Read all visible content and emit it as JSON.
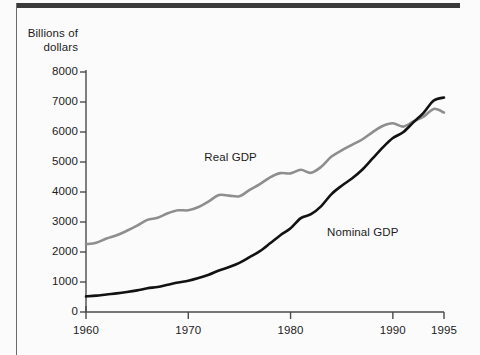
{
  "figure": {
    "background_color": "#fbfbfb",
    "frame_color": "#3a3a3a"
  },
  "chart_data": {
    "type": "line",
    "title": "",
    "subtitle": "",
    "ylabel": "Billions of\ndollars",
    "ylabel_line1": "Billions of",
    "ylabel_line2": "dollars",
    "xlabel": "",
    "xlim": [
      1960,
      1995
    ],
    "ylim": [
      0,
      8000
    ],
    "grid": false,
    "legend_position": "inline-annotations",
    "yticks": [
      0,
      1000,
      2000,
      3000,
      4000,
      5000,
      6000,
      7000,
      8000
    ],
    "ytick_labels": [
      "0",
      "1000",
      "2000",
      "3000",
      "4000",
      "5000",
      "6000",
      "7000",
      "8000"
    ],
    "xticks": [
      1960,
      1970,
      1980,
      1990,
      1995
    ],
    "xtick_labels": [
      "1960",
      "1970",
      "1980",
      "1990",
      "1995"
    ],
    "x": [
      1960,
      1961,
      1962,
      1963,
      1964,
      1965,
      1966,
      1967,
      1968,
      1969,
      1970,
      1971,
      1972,
      1973,
      1974,
      1975,
      1976,
      1977,
      1978,
      1979,
      1980,
      1981,
      1982,
      1983,
      1984,
      1985,
      1986,
      1987,
      1988,
      1989,
      1990,
      1991,
      1992,
      1993,
      1994,
      1995
    ],
    "series": [
      {
        "name": "Real GDP",
        "color": "#8e8e8e",
        "line_width": 2.6,
        "label_x": 1974.5,
        "label_y": 5150,
        "values": [
          2260,
          2310,
          2450,
          2560,
          2710,
          2880,
          3070,
          3140,
          3290,
          3390,
          3390,
          3500,
          3690,
          3900,
          3880,
          3860,
          4070,
          4260,
          4490,
          4630,
          4620,
          4740,
          4640,
          4840,
          5180,
          5390,
          5570,
          5750,
          5990,
          6200,
          6290,
          6180,
          6350,
          6510,
          6770,
          6650
        ]
      },
      {
        "name": "Nominal GDP",
        "color": "#121212",
        "line_width": 2.6,
        "label_x": 1986.5,
        "label_y": 2650,
        "values": [
          520,
          545,
          585,
          620,
          665,
          720,
          790,
          835,
          910,
          985,
          1040,
          1130,
          1240,
          1385,
          1500,
          1640,
          1830,
          2030,
          2290,
          2560,
          2790,
          3130,
          3260,
          3530,
          3930,
          4210,
          4450,
          4740,
          5110,
          5480,
          5800,
          5990,
          6320,
          6640,
          7050,
          7150
        ]
      }
    ]
  }
}
